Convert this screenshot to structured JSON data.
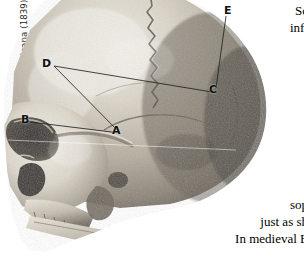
{
  "figure": {
    "credit": "Samuel Morton's Crania Americana (1839)",
    "alt_name": "human-skull-lateral-photograph",
    "measurement_labels": [
      {
        "letter": "A",
        "x": 116,
        "y": 131
      },
      {
        "letter": "B",
        "x": 25,
        "y": 120
      },
      {
        "letter": "C",
        "x": 213,
        "y": 90
      },
      {
        "letter": "D",
        "x": 46,
        "y": 64
      },
      {
        "letter": "E",
        "x": 228,
        "y": 11
      }
    ],
    "measurement_lines": [
      {
        "from": "D",
        "to": "C"
      },
      {
        "from": "D",
        "to": "A"
      },
      {
        "from": "B",
        "to": "A"
      },
      {
        "from": "E",
        "to": "C"
      }
    ],
    "colors": {
      "background": "#ffffff",
      "bone_light": "#e6e2d9",
      "bone_mid": "#b9b2a4",
      "bone_dark": "#6d675c",
      "shadow": "#3a3630",
      "line": "#2a2a2a",
      "text": "#000000"
    }
  },
  "text_top": {
    "lines": [
      "Sc",
      "infl",
      "i"
    ]
  },
  "text_bottom": {
    "lines": [
      "",
      "sop",
      "just as sh",
      "In medieval E"
    ]
  }
}
